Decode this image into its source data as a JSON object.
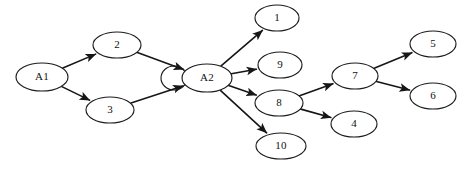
{
  "diagram": {
    "type": "directed-graph",
    "background_color": "#ffffff",
    "node_fill_color": "#ffffff",
    "node_stroke_color": "#1c1c1c",
    "edge_color": "#161616",
    "width": 467,
    "height": 171,
    "nodes": [
      {
        "id": "A1",
        "label": "A1",
        "cx": 42,
        "cy": 77,
        "rx": 26,
        "ry": 14
      },
      {
        "id": "n2",
        "label": "2",
        "cx": 117,
        "cy": 45,
        "rx": 24,
        "ry": 13
      },
      {
        "id": "n3",
        "label": "3",
        "cx": 110,
        "cy": 110,
        "rx": 24,
        "ry": 13
      },
      {
        "id": "A2",
        "label": "A2",
        "cx": 207,
        "cy": 78,
        "rx": 25,
        "ry": 14
      },
      {
        "id": "n1",
        "label": "1",
        "cx": 277,
        "cy": 18,
        "rx": 22,
        "ry": 13
      },
      {
        "id": "n9",
        "label": "9",
        "cx": 280,
        "cy": 65,
        "rx": 22,
        "ry": 13
      },
      {
        "id": "n8",
        "label": "8",
        "cx": 279,
        "cy": 103,
        "rx": 24,
        "ry": 13
      },
      {
        "id": "n10",
        "label": "10",
        "cx": 281,
        "cy": 146,
        "rx": 25,
        "ry": 13
      },
      {
        "id": "n7",
        "label": "7",
        "cx": 355,
        "cy": 76,
        "rx": 23,
        "ry": 13
      },
      {
        "id": "n4",
        "label": "4",
        "cx": 354,
        "cy": 124,
        "rx": 23,
        "ry": 13
      },
      {
        "id": "n5",
        "label": "5",
        "cx": 433,
        "cy": 44,
        "rx": 23,
        "ry": 13
      },
      {
        "id": "n6",
        "label": "6",
        "cx": 433,
        "cy": 96,
        "rx": 23,
        "ry": 13
      }
    ],
    "edges": [
      {
        "from": "A1",
        "to": "n2",
        "label": "A1-to-2"
      },
      {
        "from": "A1",
        "to": "n3",
        "label": "A1-to-3"
      },
      {
        "from": "n2",
        "to": "A2",
        "label": "2-to-A2"
      },
      {
        "from": "n3",
        "to": "A2",
        "label": "3-to-A2"
      },
      {
        "from": "A2",
        "to": "n1",
        "label": "A2-to-1"
      },
      {
        "from": "A2",
        "to": "n9",
        "label": "A2-to-9"
      },
      {
        "from": "A2",
        "to": "n8",
        "label": "A2-to-8"
      },
      {
        "from": "A2",
        "to": "n10",
        "label": "A2-to-10"
      },
      {
        "from": "n8",
        "to": "n7",
        "label": "8-to-7"
      },
      {
        "from": "n8",
        "to": "n4",
        "label": "8-to-4"
      },
      {
        "from": "n7",
        "to": "n5",
        "label": "7-to-5"
      },
      {
        "from": "n7",
        "to": "n6",
        "label": "7-to-6"
      }
    ],
    "decorations": [
      {
        "id": "arc-left-of-A2",
        "label": "partial-ellipse-arc",
        "cx": 174,
        "cy": 78,
        "rx": 13,
        "ry": 12
      }
    ]
  }
}
